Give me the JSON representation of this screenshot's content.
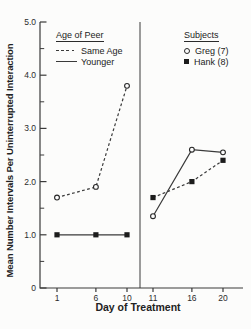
{
  "figure": {
    "background_color": "#fcfcfb",
    "ink_color": "#2b2b2b"
  },
  "legends": {
    "age_of_peer": {
      "title": "Age of Peer",
      "items": [
        {
          "label": "Same Age",
          "line_style": "dashed"
        },
        {
          "label": "Younger",
          "line_style": "solid"
        }
      ]
    },
    "subjects": {
      "title": "Subjects",
      "items": [
        {
          "label": "Greg (7)",
          "marker": "circle-open"
        },
        {
          "label": "Hank (8)",
          "marker": "square-filled"
        }
      ]
    }
  },
  "chart_data": {
    "type": "line",
    "title": "",
    "xlabel": "Day of Treatment",
    "ylabel": "Mean Number Intervals Per Uninterrupted Interaction",
    "ylim": [
      0,
      5.0
    ],
    "grid": "off",
    "legend_position": "top-left and top-right inside plot",
    "panel_divider_after_day": 10,
    "panels": [
      {
        "name": "left",
        "day_range": [
          1,
          10
        ]
      },
      {
        "name": "right",
        "day_range": [
          11,
          20
        ]
      }
    ],
    "y_axis": {
      "major": [
        0,
        1,
        2,
        3,
        4,
        5
      ],
      "labels": [
        "0",
        "1.0",
        "2.0",
        "3.0",
        "4.0",
        "5.0"
      ],
      "minor": [
        0.5,
        1.5,
        2.5,
        3.5,
        4.5
      ]
    },
    "x_axis": {
      "ticks": [
        1,
        6,
        10,
        11,
        16,
        20
      ],
      "labels": [
        "1",
        "6",
        "10",
        "11",
        "16",
        "20"
      ]
    },
    "series": [
      {
        "name": "Same Age — Greg (7)",
        "panel": "left",
        "line": "dashed",
        "marker": "circle-open",
        "x": [
          1,
          6,
          10
        ],
        "values": [
          1.7,
          1.9,
          3.8
        ]
      },
      {
        "name": "Younger — Hank (8)",
        "panel": "left",
        "line": "solid",
        "marker": "square-filled",
        "x": [
          1,
          6,
          10
        ],
        "values": [
          1.0,
          1.0,
          1.0
        ]
      },
      {
        "name": "Greg (7)",
        "panel": "right",
        "line": "solid",
        "marker": "circle-open",
        "x": [
          11,
          16,
          20
        ],
        "values": [
          1.35,
          2.6,
          2.55
        ]
      },
      {
        "name": "Hank (8)",
        "panel": "right",
        "line": "dashed",
        "marker": "square-filled",
        "x": [
          11,
          16,
          20
        ],
        "values": [
          1.7,
          2.0,
          2.4
        ]
      }
    ]
  }
}
